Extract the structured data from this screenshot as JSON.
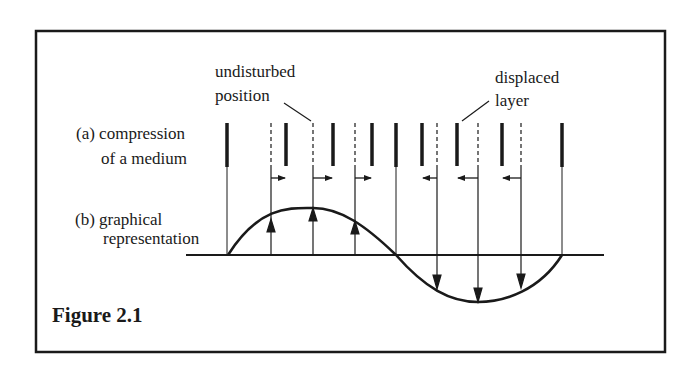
{
  "figure": {
    "caption": "Figure 2.1",
    "labels": {
      "a_line1": "(a) compression",
      "a_line2": "of a medium",
      "b_line1": "(b) graphical",
      "b_line2": "representation",
      "undisturbed_line1": "undisturbed",
      "undisturbed_line2": "position",
      "displaced_line1": "displaced",
      "displaced_line2": "layer"
    },
    "colors": {
      "ink": "#1a1a1a",
      "background": "#ffffff"
    },
    "layers": [
      {
        "undisturbed_x": 227,
        "displaced_x": 227,
        "direction": "none"
      },
      {
        "undisturbed_x": 271,
        "displaced_x": 286,
        "direction": "right"
      },
      {
        "undisturbed_x": 313,
        "displaced_x": 333,
        "direction": "right"
      },
      {
        "undisturbed_x": 355,
        "displaced_x": 372,
        "direction": "right"
      },
      {
        "undisturbed_x": 396,
        "displaced_x": 396,
        "direction": "none"
      },
      {
        "undisturbed_x": 437,
        "displaced_x": 422,
        "direction": "left"
      },
      {
        "undisturbed_x": 478,
        "displaced_x": 457,
        "direction": "left"
      },
      {
        "undisturbed_x": 521,
        "displaced_x": 502,
        "direction": "left"
      },
      {
        "undisturbed_x": 562,
        "displaced_x": 562,
        "direction": "none"
      }
    ],
    "graph": {
      "axis_y": 255,
      "axis_x_start": 186,
      "axis_x_end": 604,
      "curve_start_x": 228,
      "curve_end_x": 562,
      "amplitude": 47,
      "displacement_arrows": [
        {
          "x": 271,
          "direction": "up"
        },
        {
          "x": 313,
          "direction": "up"
        },
        {
          "x": 355,
          "direction": "up"
        },
        {
          "x": 437,
          "direction": "down"
        },
        {
          "x": 478,
          "direction": "down"
        },
        {
          "x": 521,
          "direction": "down"
        }
      ]
    }
  }
}
